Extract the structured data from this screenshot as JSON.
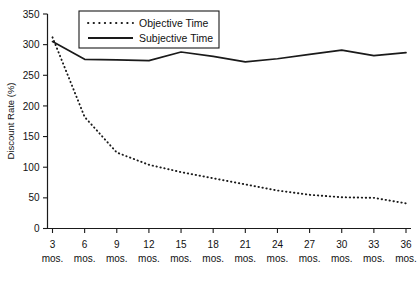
{
  "chart_data": {
    "type": "line",
    "title": "",
    "xlabel": "",
    "ylabel": "Discount Rate (%)",
    "xlim": [
      3,
      36
    ],
    "ylim": [
      0,
      350
    ],
    "grid": false,
    "legend_position": "top-center",
    "categories": [
      "3 mos.",
      "6 mos.",
      "9 mos.",
      "12 mos.",
      "15 mos.",
      "18 mos.",
      "21 mos.",
      "24 mos.",
      "27 mos.",
      "30 mos.",
      "33 mos.",
      "36 mos."
    ],
    "x": [
      3,
      6,
      9,
      12,
      15,
      18,
      21,
      24,
      27,
      30,
      33,
      36
    ],
    "y_ticks": [
      0,
      50,
      100,
      150,
      200,
      250,
      300,
      350
    ],
    "series": [
      {
        "name": "Objective Time",
        "style": "dotted",
        "color": "#1a1a1a",
        "values": [
          312,
          182,
          124,
          104,
          92,
          82,
          72,
          62,
          55,
          51,
          50,
          41
        ]
      },
      {
        "name": "Subjective Time",
        "style": "solid",
        "color": "#1a1a1a",
        "values": [
          305,
          276,
          275,
          274,
          288,
          281,
          272,
          277,
          284,
          291,
          282,
          287
        ]
      }
    ]
  },
  "legend": {
    "entries": [
      {
        "label": "Objective Time",
        "style": "dotted"
      },
      {
        "label": "Subjective Time",
        "style": "solid"
      }
    ]
  },
  "axes": {
    "y_title": "Discount Rate (%)",
    "y_tick_labels": [
      "0",
      "50",
      "100",
      "150",
      "200",
      "250",
      "300",
      "350"
    ],
    "x_tick_numbers": [
      "3",
      "6",
      "9",
      "12",
      "15",
      "18",
      "21",
      "24",
      "27",
      "30",
      "33",
      "36"
    ],
    "x_tick_units": [
      "mos.",
      "mos.",
      "mos.",
      "mos.",
      "mos.",
      "mos.",
      "mos.",
      "mos.",
      "mos.",
      "mos.",
      "mos.",
      "mos."
    ]
  }
}
